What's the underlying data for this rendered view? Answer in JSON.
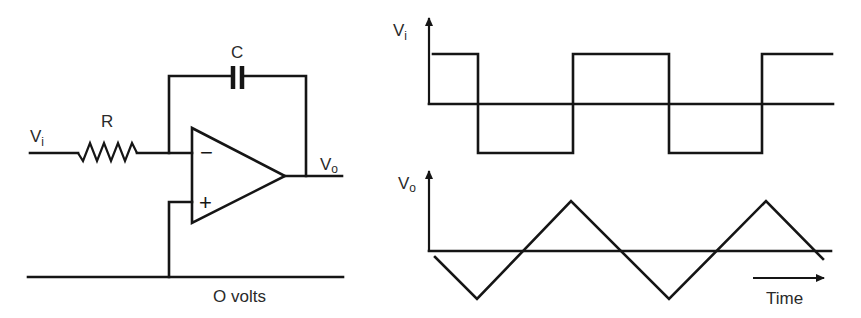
{
  "circuit": {
    "input_label": {
      "main": "V",
      "sub": "i"
    },
    "resistor_label": "R",
    "capacitor_label": "C",
    "output_label": {
      "main": "V",
      "sub": "o"
    },
    "inverting_input_symbol": "−",
    "non_inverting_input_symbol": "+",
    "ground_label": "O volts"
  },
  "waveforms": {
    "input": {
      "axis_label": {
        "main": "V",
        "sub": "i"
      },
      "shape": "square",
      "levels_sequence": [
        1,
        -1,
        1,
        -1,
        1
      ]
    },
    "output": {
      "axis_label": {
        "main": "V",
        "sub": "o"
      },
      "shape": "triangle",
      "extrema_sequence": [
        -1,
        1,
        -1,
        1
      ]
    },
    "time_label": "Time"
  },
  "colors": {
    "ink": "#151515",
    "background": "#ffffff"
  }
}
